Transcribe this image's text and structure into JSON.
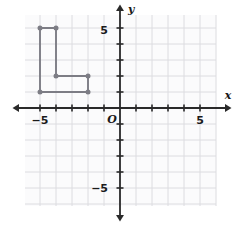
{
  "chart_data": {
    "type": "scatter",
    "title": "",
    "subtitle": "",
    "xlabel": "x",
    "ylabel": "y",
    "origin_label": "O",
    "xlim": [
      -6.0,
      6.0
    ],
    "ylim": [
      -6.0,
      6.0
    ],
    "grid": true,
    "grid_step": 1,
    "legend": "none",
    "x_tick_labels": [
      {
        "value": -5,
        "text": "−5"
      },
      {
        "value": 5,
        "text": "5"
      }
    ],
    "y_tick_labels": [
      {
        "value": 5,
        "text": "5"
      },
      {
        "value": -5,
        "text": "−5"
      }
    ],
    "x_ticks": [
      -5,
      -4,
      -3,
      -2,
      -1,
      1,
      2,
      3,
      4,
      5
    ],
    "y_ticks": [
      -5,
      -4,
      -3,
      -2,
      -1,
      1,
      2,
      3,
      4,
      5
    ],
    "series": [
      {
        "name": "L-shaped figure",
        "shape": "closed-polygon",
        "stroke": "#7d7d85",
        "marker": "filled-circle",
        "marker_color": "#7d7d85",
        "points": [
          {
            "x": -5,
            "y": 5
          },
          {
            "x": -4,
            "y": 5
          },
          {
            "x": -4,
            "y": 2
          },
          {
            "x": -2,
            "y": 2
          },
          {
            "x": -2,
            "y": 1
          },
          {
            "x": -5,
            "y": 1
          }
        ]
      }
    ]
  },
  "colors": {
    "background": "#ffffff",
    "grid_line": "#dcdce0",
    "grid_area": "#fbfbfc",
    "axis": "#2a2a2a",
    "figure_stroke": "#7d7d85",
    "figure_vertex": "#76767e",
    "label_text": "#1a1a1a"
  },
  "geometry": {
    "origin_px": {
      "x": 120,
      "y": 108
    },
    "unit_px": 16,
    "grid_bounds_px": {
      "left": 25,
      "top": 15,
      "right": 216,
      "bottom": 206
    },
    "axis_x_span_px": {
      "start": 18,
      "end": 226
    },
    "axis_y_span_px": {
      "start": 10,
      "end": 216
    }
  },
  "labels": {
    "x_axis": "x",
    "y_axis": "y",
    "origin": "O",
    "x_neg_five": "−5",
    "x_pos_five": "5",
    "y_pos_five": "5",
    "y_neg_five": "−5"
  }
}
